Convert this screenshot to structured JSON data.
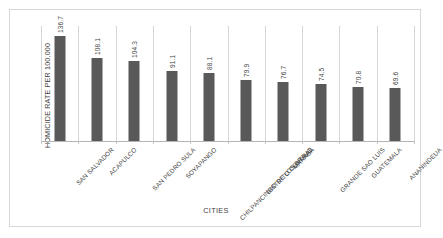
{
  "figure": {
    "background_color": "#ffffff",
    "border_color": "#d8d8d8",
    "bar_color": "#595959",
    "text_color": "#3f3f3f",
    "gridline_color": "#d6d6d6"
  },
  "chart_data": {
    "type": "bar",
    "title": "",
    "subtitle": "",
    "xlabel": "CITIES",
    "ylabel": "HOMICIDE RATE PER 100,000",
    "orientation": "vertical",
    "grid": "vertical-category-separators",
    "legend": "none",
    "ylim": [
      0,
      150
    ],
    "ytick_labels": [],
    "categories": [
      "SAN SALVADOR",
      "ACAPULCO",
      "SAN PEDRO SULA",
      "SOYAPANGO",
      "CHILPANCINGO DE LOS BRAVO",
      "DISTRITO CENTRAL",
      "MARABÁ",
      "GRANDE SAO LUÍS",
      "GUATEMALA",
      "ANANINDEUA"
    ],
    "values": [
      136.7,
      108.1,
      104.3,
      91.1,
      88.1,
      79.9,
      76.7,
      74.5,
      70.8,
      69.6
    ],
    "value_labels": [
      "136.7",
      "108.1",
      "104.3",
      "91.1",
      "88.1",
      "79.9",
      "76.7",
      "74.5",
      "70.8",
      "69.6"
    ],
    "series": [
      {
        "name": "Homicide rate per 100,000",
        "values": [
          136.7,
          108.1,
          104.3,
          91.1,
          88.1,
          79.9,
          76.7,
          74.5,
          70.8,
          69.6
        ]
      }
    ]
  }
}
